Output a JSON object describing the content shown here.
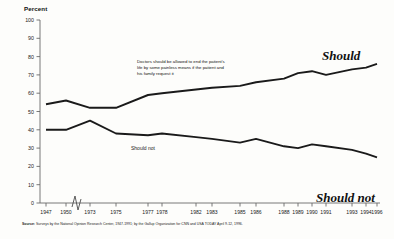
{
  "chart_data": {
    "type": "line",
    "title": "",
    "subtitle": "",
    "ylabel": "Percent",
    "xlabel": "",
    "ylim": [
      0,
      100
    ],
    "yticks": [
      0,
      10,
      20,
      30,
      40,
      50,
      60,
      70,
      80,
      90,
      100
    ],
    "grid": false,
    "legend_position": "inline-right",
    "axis_break": "between 1950 and 1973",
    "annotation": "Doctors should be allowed to end the patient's life by some painless means if the patient and his family request it",
    "x": [
      "1947",
      "1950",
      "1973",
      "1975",
      "1977",
      "1978",
      "1982",
      "1983",
      "1985",
      "1986",
      "1988",
      "1989",
      "1990",
      "1991",
      "1993",
      "1994",
      "1996"
    ],
    "categories": [
      "1947",
      "1950",
      "1973",
      "1975",
      "1977",
      "1978",
      "1982",
      "1983",
      "1985",
      "1986",
      "1988",
      "1989",
      "1990",
      "1991",
      "1993",
      "1994",
      "1996"
    ],
    "series": [
      {
        "name": "Should",
        "values": [
          54,
          56,
          52,
          52,
          59,
          60,
          62,
          63,
          64,
          66,
          68,
          71,
          72,
          70,
          73,
          74,
          76
        ]
      },
      {
        "name": "Should not",
        "values": [
          40,
          40,
          45,
          38,
          37,
          38,
          36,
          35,
          33,
          35,
          31,
          30,
          32,
          31,
          29,
          27,
          25
        ]
      }
    ]
  },
  "axis": {
    "y_title": "Percent",
    "y_labels": [
      "100",
      "90",
      "80",
      "70",
      "60",
      "50",
      "40",
      "30",
      "20",
      "10",
      "0"
    ],
    "x_labels": [
      "1947",
      "1950",
      "1973",
      "1975",
      "1977",
      "1978",
      "1982",
      "1983",
      "1985",
      "1986",
      "1988",
      "1989",
      "1990",
      "1991",
      "1993",
      "1994",
      "1996"
    ]
  },
  "labels": {
    "should": "Should",
    "should_not": "Should not",
    "should_not_inline": "Should not"
  },
  "annotation": {
    "text": "Doctors should be allowed to end the patient's life by some painless means if the patient and his family request it"
  },
  "source": {
    "prefix": "Source:",
    "text": "Surveys by the National Opinion Research Center, 1947-1991; by the Gallup Organization for CNN and USA TODAY April 9-12, 1996."
  }
}
